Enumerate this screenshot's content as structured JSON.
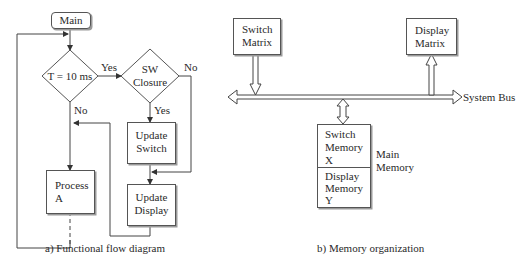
{
  "flow": {
    "start": "Main",
    "decision1": "T = 10 ms",
    "decision1_yes": "Yes",
    "decision1_no": "No",
    "decision2_line1": "SW",
    "decision2_line2": "Closure",
    "decision2_yes": "Yes",
    "decision2_no": "No",
    "process_a_line1": "Process",
    "process_a_line2": "A",
    "update_switch_line1": "Update",
    "update_switch_line2": "Switch",
    "update_display_line1": "Update",
    "update_display_line2": "Display",
    "caption": "a) Functional flow diagram"
  },
  "memory": {
    "switch_matrix_line1": "Switch",
    "switch_matrix_line2": "Matrix",
    "display_matrix_line1": "Display",
    "display_matrix_line2": "Matrix",
    "bus_label": "System Bus",
    "switch_memory_line1": "Switch",
    "switch_memory_line2": "Memory",
    "switch_memory_line3": "X",
    "display_memory_line1": "Display",
    "display_memory_line2": "Memory",
    "display_memory_line3": "Y",
    "main_memory_line1": "Main",
    "main_memory_line2": "Memory",
    "caption": "b) Memory organization"
  }
}
